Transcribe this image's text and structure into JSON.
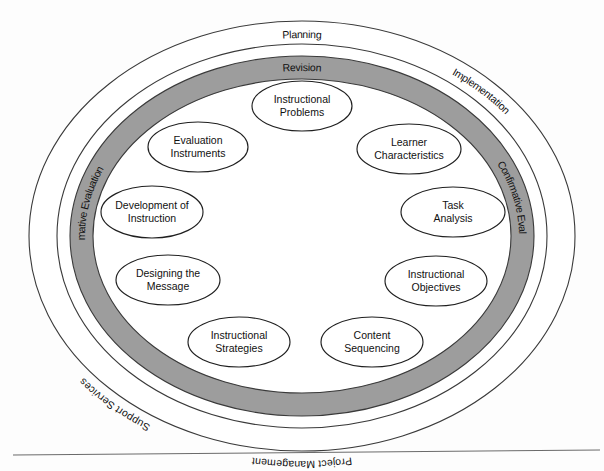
{
  "diagram": {
    "type": "concentric-oval-model",
    "colors": {
      "ring_gray": "#9d9d9d",
      "ring_white": "#ffffff",
      "outline": "#3a3a3a",
      "node_outline": "#1f1f1f",
      "text": "#111111",
      "footer_rule": "#6b6b6b",
      "page_background": "#fdfdfd"
    },
    "rings": [
      {
        "id": "outer-ring",
        "fill": "white",
        "labels": [
          {
            "id": "planning",
            "text": "Planning",
            "position": "top-center"
          },
          {
            "id": "implementation",
            "text": "Implementation",
            "position": "top-right"
          },
          {
            "id": "summative-evaluation",
            "text": "Summative Evaluation",
            "position": "right"
          },
          {
            "id": "project-management",
            "text": "Project Management",
            "position": "bottom-center"
          },
          {
            "id": "support-services",
            "text": "Support Services",
            "position": "bottom-left"
          }
        ]
      },
      {
        "id": "inner-ring",
        "fill": "gray",
        "labels": [
          {
            "id": "revision",
            "text": "Revision",
            "position": "top-center"
          },
          {
            "id": "confirmative-evaluation",
            "text": "Confirmative Evaluation",
            "position": "left"
          },
          {
            "id": "formative-evaluation",
            "text": "Formative Evaluation",
            "position": "bottom-center"
          }
        ]
      }
    ],
    "nodes": [
      {
        "id": "instructional-problems",
        "line1": "Instructional",
        "line2": "Problems",
        "cx": 302,
        "cy": 106,
        "rx": 50,
        "ry": 25
      },
      {
        "id": "evaluation-instruments",
        "line1": "Evaluation",
        "line2": "Instruments",
        "cx": 198,
        "cy": 147,
        "rx": 50,
        "ry": 25
      },
      {
        "id": "learner-characteristics",
        "line1": "Learner",
        "line2": "Characteristics",
        "cx": 409,
        "cy": 149,
        "rx": 52,
        "ry": 25
      },
      {
        "id": "development-of-instruction",
        "line1": "Development of",
        "line2": "Instruction",
        "cx": 152,
        "cy": 212,
        "rx": 51,
        "ry": 26
      },
      {
        "id": "task-analysis",
        "line1": "Task",
        "line2": "Analysis",
        "cx": 453,
        "cy": 212,
        "rx": 52,
        "ry": 25
      },
      {
        "id": "designing-the-message",
        "line1": "Designing the",
        "line2": "Message",
        "cx": 168,
        "cy": 280,
        "rx": 52,
        "ry": 25
      },
      {
        "id": "instructional-objectives",
        "line1": "Instructional",
        "line2": "Objectives",
        "cx": 436,
        "cy": 281,
        "rx": 51,
        "ry": 25
      },
      {
        "id": "instructional-strategies",
        "line1": "Instructional",
        "line2": "Strategies",
        "cx": 239,
        "cy": 342,
        "rx": 51,
        "ry": 25
      },
      {
        "id": "content-sequencing",
        "line1": "Content",
        "line2": "Sequencing",
        "cx": 372,
        "cy": 342,
        "rx": 51,
        "ry": 25
      }
    ]
  }
}
